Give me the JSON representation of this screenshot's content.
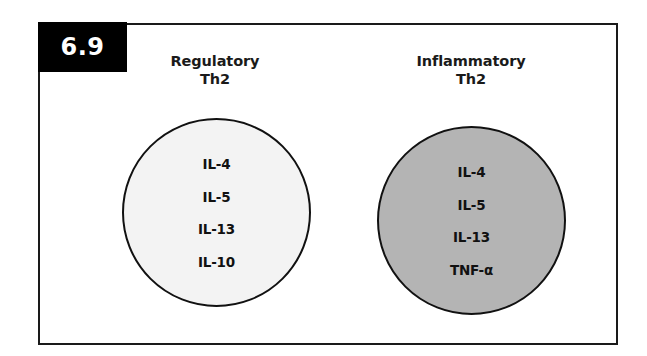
{
  "figure": {
    "number": "6.9",
    "badge_color": "#000000",
    "badge_text_color": "#ffffff",
    "frame_color": "#1a1a1a",
    "background": "#ffffff"
  },
  "groups": [
    {
      "id": "regulatory",
      "title_line1": "Regulatory",
      "title_line2": "Th2",
      "circle_fill": "#f3f3f3",
      "circle_stroke": "#111111",
      "cytokines": [
        "IL-4",
        "IL-5",
        "IL-13",
        "IL-10"
      ]
    },
    {
      "id": "inflammatory",
      "title_line1": "Inflammatory",
      "title_line2": "Th2",
      "circle_fill": "#b4b4b4",
      "circle_stroke": "#111111",
      "cytokines": [
        "IL-4",
        "IL-5",
        "IL-13",
        "TNF-α"
      ]
    }
  ]
}
